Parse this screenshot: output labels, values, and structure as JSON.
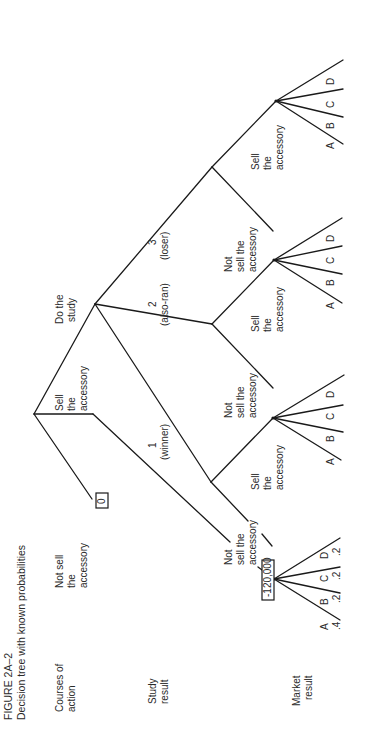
{
  "figure": {
    "number": "FIGURE 2A–2",
    "caption": "Decision tree with known probabilities",
    "orientation": "rotated 90° counter-clockwise"
  },
  "row_labels": {
    "courses_of_action": [
      "Courses of",
      "action"
    ],
    "study_result": [
      "Study",
      "result"
    ],
    "market_result": [
      "Market",
      "result"
    ]
  },
  "tree": {
    "root_branches": {
      "not_sell": [
        "Not sell",
        "the",
        "accessory"
      ],
      "sell": [
        "Sell",
        "the",
        "accessory"
      ],
      "do_study": [
        "Do the",
        "study"
      ]
    },
    "not_sell_payoff": "0",
    "sell_outcome_payoff": "-120,000",
    "study_results": [
      {
        "num": "1",
        "label": "(winner)"
      },
      {
        "num": "2",
        "label": "(also-ran)"
      },
      {
        "num": "3",
        "label": "(loser)"
      }
    ],
    "sub_decisions": {
      "sell": [
        "Sell",
        "the",
        "accessory"
      ],
      "not_sell_winner": [
        "Not",
        "sell the",
        "accessory"
      ],
      "not_sell": [
        "Not",
        "sell the",
        "accessory"
      ],
      "not_sell_root": [
        "Not",
        "sell the",
        "accessory"
      ]
    },
    "market_outcomes": [
      "A",
      "B",
      "C",
      "D"
    ],
    "market_probabilities": [
      ".4",
      ".2",
      ".2",
      ".2"
    ]
  }
}
